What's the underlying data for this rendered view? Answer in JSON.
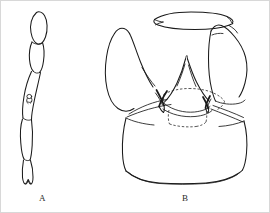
{
  "plate": {
    "background_color": "#ffffff",
    "ink_color": "#1a1a1a",
    "border_color": "#d8d8d8",
    "width": 270,
    "height": 213,
    "medium": "pen-and-ink line drawing",
    "subject": "insect morphology: segmented appendage and terminalia"
  },
  "figures": [
    {
      "id": "figure-a",
      "label": "A",
      "label_x": 38,
      "label_y": 192,
      "description": "elongate segmented appendage (antenna / leg) drawn in lateral view, five articulated segments, oblique orientation top-left to bottom",
      "parts": [
        {
          "name": "apical-oval-segment",
          "note": "narrow elongate oval at top"
        },
        {
          "name": "second-segment",
          "note": "short tapering segment"
        },
        {
          "name": "third-segment",
          "note": "long slender segment bearing sensillum"
        },
        {
          "name": "sensillum",
          "note": "small circular sense organ on third segment"
        },
        {
          "name": "fourth-segment",
          "note": "broader ovoid segment"
        },
        {
          "name": "terminal-segment",
          "note": "short truncate segment with notched apex"
        }
      ]
    },
    {
      "id": "figure-b",
      "label": "B",
      "label_x": 181,
      "label_y": 192,
      "description": "terminalia / genital capsule in posterior view, bilaterally symmetric, with paired lateral lobes, median spire-like process, paired dark sclerotized stylets and dashed hidden internal outlines",
      "parts": [
        {
          "name": "dorsal-band",
          "note": "elongate curved transverse sclerite across top with hooked left end"
        },
        {
          "name": "left-lateral-lobe",
          "note": "large rounded leaf-shaped lobe with internal fold line"
        },
        {
          "name": "right-lateral-lobe",
          "note": "angular sub-rectangular lobe"
        },
        {
          "name": "median-process",
          "note": "central triangular spire-like projection"
        },
        {
          "name": "left-stylet",
          "note": "dark thick crossing stylet, left side"
        },
        {
          "name": "right-stylet",
          "note": "dark thick crossing stylet, right side"
        },
        {
          "name": "hidden-outline",
          "note": "dashed lines indicating concealed internal sclerites"
        },
        {
          "name": "basal-plate",
          "note": "large bell / trapezoid shaped basal plate with flat base"
        }
      ]
    }
  ]
}
